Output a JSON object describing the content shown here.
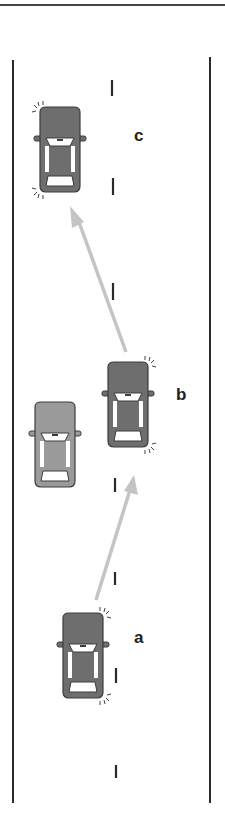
{
  "diagram": {
    "labels": {
      "a": "a",
      "b": "b",
      "c": "c"
    },
    "colors": {
      "car_dark": "#6e6e6e",
      "car_light": "#9a9a9a",
      "car_outline": "#3c3c3c",
      "arrow": "#c4c4c4",
      "road_line": "#2a2a2a"
    },
    "elements": [
      {
        "id": "car-a",
        "position": "start, lane right of left edge",
        "blinker": "right"
      },
      {
        "id": "car-b",
        "position": "passing lane",
        "blinker": "right"
      },
      {
        "id": "car-c",
        "position": "returned to lane",
        "blinker": "left"
      },
      {
        "id": "overtaken-car",
        "shade": "light"
      },
      {
        "id": "arrow-a-to-b"
      },
      {
        "id": "arrow-b-to-c"
      }
    ]
  }
}
